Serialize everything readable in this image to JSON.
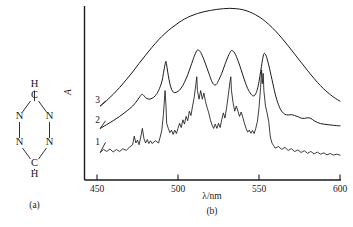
{
  "figure": {
    "panels": [
      {
        "id": "a",
        "label": "(a)",
        "caption": "(a)"
      },
      {
        "id": "b",
        "label": "(b)",
        "caption": "(b)"
      }
    ]
  },
  "molecule": {
    "name": "s-tetrazine-ring",
    "atoms": [
      {
        "symbol": "H",
        "x": 34.5,
        "y": 85,
        "name": "hydrogen-top"
      },
      {
        "symbol": "C",
        "x": 34.5,
        "y": 96,
        "name": "carbon-top"
      },
      {
        "symbol": "N",
        "x": 19.5,
        "y": 117,
        "name": "nitrogen-upper-left"
      },
      {
        "symbol": "N",
        "x": 49.5,
        "y": 117,
        "name": "nitrogen-upper-right"
      },
      {
        "symbol": "N",
        "x": 19.5,
        "y": 143,
        "name": "nitrogen-lower-left"
      },
      {
        "symbol": "N",
        "x": 49.5,
        "y": 143,
        "name": "nitrogen-lower-right"
      },
      {
        "symbol": "C",
        "x": 34.5,
        "y": 164,
        "name": "carbon-bottom"
      },
      {
        "symbol": "H",
        "x": 34.5,
        "y": 175,
        "name": "hydrogen-bottom"
      }
    ],
    "bonds": [
      [
        34.5,
        101,
        34.5,
        90.5
      ],
      [
        30.5,
        101,
        22.5,
        112
      ],
      [
        38.5,
        101,
        46.5,
        112
      ],
      [
        19.5,
        122,
        19.5,
        138
      ],
      [
        49.5,
        122,
        49.5,
        138
      ],
      [
        22.5,
        148,
        30.5,
        159
      ],
      [
        46.5,
        148,
        38.5,
        159
      ],
      [
        34.5,
        169,
        34.5,
        170.5
      ]
    ]
  },
  "chart_data": {
    "type": "line",
    "title": "",
    "xlabel": "λ/nm",
    "ylabel": "A",
    "xlim": [
      450,
      600
    ],
    "ylim": [
      0,
      1
    ],
    "grid": false,
    "legend_position": "inline-left",
    "xticks": [
      450,
      500,
      550,
      600
    ],
    "xticklabels": [
      "450",
      "500",
      "550",
      "600"
    ],
    "yticks": [],
    "yticklabels": [],
    "series": [
      {
        "name": "1",
        "label": "1",
        "description": "low-temperature high-resolution spectrum with sharp vibronic fine structure",
        "label_x": 452.5,
        "label_y": 0.205,
        "points": [
          [
            452,
            0.16
          ],
          [
            454,
            0.178
          ],
          [
            456,
            0.166
          ],
          [
            458,
            0.18
          ],
          [
            460,
            0.163
          ],
          [
            462,
            0.177
          ],
          [
            464,
            0.166
          ],
          [
            466,
            0.182
          ],
          [
            468,
            0.172
          ],
          [
            470,
            0.19
          ],
          [
            472,
            0.205
          ],
          [
            473,
            0.255
          ],
          [
            474,
            0.215
          ],
          [
            475,
            0.232
          ],
          [
            476,
            0.205
          ],
          [
            477,
            0.25
          ],
          [
            478,
            0.3
          ],
          [
            479,
            0.24
          ],
          [
            480,
            0.215
          ],
          [
            481,
            0.235
          ],
          [
            482,
            0.212
          ],
          [
            483,
            0.228
          ],
          [
            484,
            0.212
          ],
          [
            486,
            0.228
          ],
          [
            488,
            0.215
          ],
          [
            489,
            0.25
          ],
          [
            490,
            0.29
          ],
          [
            491,
            0.38
          ],
          [
            492,
            0.52
          ],
          [
            492.6,
            0.43
          ],
          [
            493,
            0.33
          ],
          [
            494,
            0.3
          ],
          [
            495,
            0.275
          ],
          [
            496,
            0.29
          ],
          [
            497,
            0.265
          ],
          [
            498,
            0.29
          ],
          [
            499,
            0.27
          ],
          [
            500,
            0.3
          ],
          [
            501,
            0.33
          ],
          [
            502,
            0.305
          ],
          [
            503,
            0.35
          ],
          [
            504,
            0.325
          ],
          [
            505,
            0.37
          ],
          [
            506,
            0.345
          ],
          [
            507,
            0.4
          ],
          [
            508,
            0.375
          ],
          [
            509,
            0.43
          ],
          [
            510,
            0.48
          ],
          [
            511,
            0.555
          ],
          [
            511.6,
            0.6
          ],
          [
            512,
            0.52
          ],
          [
            513,
            0.47
          ],
          [
            514,
            0.52
          ],
          [
            515,
            0.47
          ],
          [
            516,
            0.505
          ],
          [
            517,
            0.455
          ],
          [
            518,
            0.42
          ],
          [
            519,
            0.39
          ],
          [
            520,
            0.35
          ],
          [
            521,
            0.32
          ],
          [
            522,
            0.3
          ],
          [
            523,
            0.325
          ],
          [
            524,
            0.3
          ],
          [
            525,
            0.33
          ],
          [
            526,
            0.305
          ],
          [
            527,
            0.35
          ],
          [
            528,
            0.39
          ],
          [
            529,
            0.36
          ],
          [
            530,
            0.42
          ],
          [
            531,
            0.49
          ],
          [
            532,
            0.565
          ],
          [
            532.6,
            0.6
          ],
          [
            533,
            0.52
          ],
          [
            534,
            0.45
          ],
          [
            535,
            0.4
          ],
          [
            536,
            0.43
          ],
          [
            537,
            0.4
          ],
          [
            538,
            0.37
          ],
          [
            539,
            0.395
          ],
          [
            540,
            0.365
          ],
          [
            541,
            0.33
          ],
          [
            542,
            0.3
          ],
          [
            543,
            0.278
          ],
          [
            544,
            0.29
          ],
          [
            545,
            0.272
          ],
          [
            546,
            0.288
          ],
          [
            547,
            0.27
          ],
          [
            548,
            0.3
          ],
          [
            549,
            0.34
          ],
          [
            550,
            0.42
          ],
          [
            551,
            0.54
          ],
          [
            551.6,
            0.64
          ],
          [
            552,
            0.56
          ],
          [
            552.6,
            0.62
          ],
          [
            553,
            0.52
          ],
          [
            554,
            0.43
          ],
          [
            555,
            0.39
          ],
          [
            556,
            0.34
          ],
          [
            557,
            0.25
          ],
          [
            558,
            0.215
          ],
          [
            559,
            0.2
          ],
          [
            560,
            0.185
          ],
          [
            562,
            0.195
          ],
          [
            564,
            0.178
          ],
          [
            566,
            0.19
          ],
          [
            568,
            0.172
          ],
          [
            570,
            0.182
          ],
          [
            572,
            0.165
          ],
          [
            574,
            0.175
          ],
          [
            576,
            0.16
          ],
          [
            578,
            0.17
          ],
          [
            580,
            0.155
          ],
          [
            582,
            0.166
          ],
          [
            584,
            0.152
          ],
          [
            586,
            0.162
          ],
          [
            588,
            0.15
          ],
          [
            590,
            0.158
          ],
          [
            592,
            0.146
          ],
          [
            594,
            0.154
          ],
          [
            596,
            0.145
          ],
          [
            598,
            0.15
          ],
          [
            600,
            0.145
          ]
        ]
      },
      {
        "name": "2",
        "label": "2",
        "description": "intermediate-resolution spectrum with partly resolved vibronic bands",
        "label_x": 452.5,
        "label_y": 0.33,
        "points": [
          [
            452,
            0.3
          ],
          [
            456,
            0.322
          ],
          [
            460,
            0.345
          ],
          [
            464,
            0.37
          ],
          [
            468,
            0.398
          ],
          [
            472,
            0.43
          ],
          [
            474,
            0.452
          ],
          [
            476,
            0.478
          ],
          [
            477,
            0.492
          ],
          [
            478,
            0.498
          ],
          [
            479,
            0.49
          ],
          [
            480,
            0.478
          ],
          [
            482,
            0.47
          ],
          [
            484,
            0.475
          ],
          [
            486,
            0.49
          ],
          [
            488,
            0.52
          ],
          [
            490,
            0.57
          ],
          [
            491,
            0.62
          ],
          [
            492,
            0.672
          ],
          [
            492.6,
            0.69
          ],
          [
            493,
            0.668
          ],
          [
            494,
            0.608
          ],
          [
            495,
            0.56
          ],
          [
            496,
            0.528
          ],
          [
            497,
            0.512
          ],
          [
            498,
            0.508
          ],
          [
            500,
            0.515
          ],
          [
            502,
            0.535
          ],
          [
            504,
            0.568
          ],
          [
            506,
            0.612
          ],
          [
            508,
            0.665
          ],
          [
            510,
            0.718
          ],
          [
            511.5,
            0.75
          ],
          [
            512.5,
            0.756
          ],
          [
            514,
            0.742
          ],
          [
            516,
            0.7
          ],
          [
            518,
            0.648
          ],
          [
            520,
            0.595
          ],
          [
            521,
            0.57
          ],
          [
            522,
            0.556
          ],
          [
            523,
            0.552
          ],
          [
            524,
            0.56
          ],
          [
            525,
            0.578
          ],
          [
            527,
            0.62
          ],
          [
            529,
            0.672
          ],
          [
            531,
            0.72
          ],
          [
            532.5,
            0.748
          ],
          [
            533.5,
            0.752
          ],
          [
            535,
            0.738
          ],
          [
            537,
            0.695
          ],
          [
            539,
            0.64
          ],
          [
            541,
            0.582
          ],
          [
            543,
            0.532
          ],
          [
            545,
            0.5
          ],
          [
            546,
            0.49
          ],
          [
            547,
            0.49
          ],
          [
            548,
            0.502
          ],
          [
            549,
            0.528
          ],
          [
            550,
            0.572
          ],
          [
            551,
            0.63
          ],
          [
            552,
            0.69
          ],
          [
            552.8,
            0.728
          ],
          [
            553.5,
            0.736
          ],
          [
            554.5,
            0.72
          ],
          [
            556,
            0.668
          ],
          [
            558,
            0.585
          ],
          [
            560,
            0.5
          ],
          [
            562,
            0.438
          ],
          [
            564,
            0.4
          ],
          [
            566,
            0.382
          ],
          [
            568,
            0.378
          ],
          [
            570,
            0.38
          ],
          [
            572,
            0.375
          ],
          [
            574,
            0.368
          ],
          [
            576,
            0.36
          ],
          [
            578,
            0.358
          ],
          [
            580,
            0.362
          ],
          [
            582,
            0.358
          ],
          [
            584,
            0.345
          ],
          [
            586,
            0.335
          ],
          [
            588,
            0.328
          ],
          [
            590,
            0.325
          ],
          [
            592,
            0.322
          ],
          [
            594,
            0.32
          ],
          [
            596,
            0.318
          ],
          [
            598,
            0.316
          ],
          [
            600,
            0.315
          ]
        ]
      },
      {
        "name": "3",
        "label": "3",
        "description": "broad unresolved envelope spectrum (solution/room temperature)",
        "label_x": 452.5,
        "label_y": 0.445,
        "points": [
          [
            452,
            0.43
          ],
          [
            456,
            0.462
          ],
          [
            460,
            0.498
          ],
          [
            464,
            0.538
          ],
          [
            468,
            0.582
          ],
          [
            472,
            0.628
          ],
          [
            476,
            0.678
          ],
          [
            480,
            0.726
          ],
          [
            484,
            0.772
          ],
          [
            488,
            0.815
          ],
          [
            492,
            0.852
          ],
          [
            496,
            0.884
          ],
          [
            500,
            0.912
          ],
          [
            504,
            0.936
          ],
          [
            508,
            0.954
          ],
          [
            512,
            0.968
          ],
          [
            516,
            0.978
          ],
          [
            520,
            0.986
          ],
          [
            524,
            0.992
          ],
          [
            528,
            0.996
          ],
          [
            532,
            0.998
          ],
          [
            536,
            0.996
          ],
          [
            540,
            0.99
          ],
          [
            544,
            0.978
          ],
          [
            548,
            0.96
          ],
          [
            552,
            0.936
          ],
          [
            556,
            0.905
          ],
          [
            560,
            0.868
          ],
          [
            564,
            0.826
          ],
          [
            568,
            0.78
          ],
          [
            572,
            0.732
          ],
          [
            576,
            0.684
          ],
          [
            580,
            0.636
          ],
          [
            584,
            0.59
          ],
          [
            588,
            0.548
          ],
          [
            592,
            0.512
          ],
          [
            596,
            0.482
          ],
          [
            600,
            0.458
          ]
        ]
      }
    ]
  }
}
